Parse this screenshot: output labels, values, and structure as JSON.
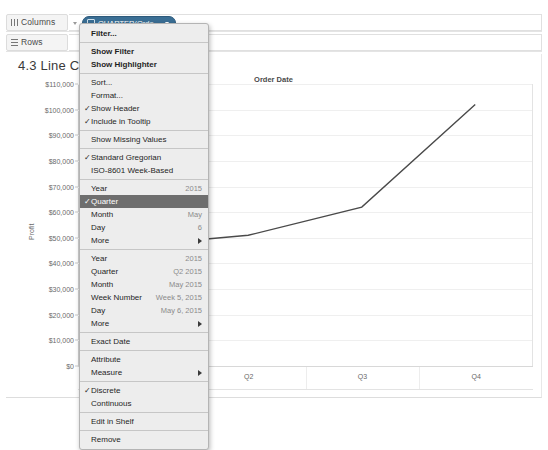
{
  "shelves": {
    "columns": {
      "label": "Columns",
      "icon": "columns-icon"
    },
    "rows": {
      "label": "Rows",
      "icon": "rows-icon"
    },
    "pill": {
      "text": "QUARTER(Orde...",
      "icon": "calendar-icon",
      "color": "#3a6e94"
    }
  },
  "sheet": {
    "title": "4.3 Line Chart",
    "chart_title": "Order Date"
  },
  "menu": {
    "items": [
      {
        "label": "Filter...",
        "check": "",
        "value": "",
        "arrow": false,
        "selected": false,
        "bold": true,
        "sep_after": true
      },
      {
        "label": "Show Filter",
        "check": "",
        "value": "",
        "arrow": false,
        "selected": false,
        "bold": true,
        "sep_after": false
      },
      {
        "label": "Show Highlighter",
        "check": "",
        "value": "",
        "arrow": false,
        "selected": false,
        "bold": true,
        "sep_after": true
      },
      {
        "label": "Sort...",
        "check": "",
        "value": "",
        "arrow": false,
        "selected": false,
        "bold": false,
        "sep_after": false
      },
      {
        "label": "Format...",
        "check": "",
        "value": "",
        "arrow": false,
        "selected": false,
        "bold": false,
        "sep_after": false
      },
      {
        "label": "Show Header",
        "check": "✓",
        "value": "",
        "arrow": false,
        "selected": false,
        "bold": false,
        "sep_after": false
      },
      {
        "label": "Include in Tooltip",
        "check": "✓",
        "value": "",
        "arrow": false,
        "selected": false,
        "bold": false,
        "sep_after": true
      },
      {
        "label": "Show Missing Values",
        "check": "",
        "value": "",
        "arrow": false,
        "selected": false,
        "bold": false,
        "sep_after": true
      },
      {
        "label": "Standard Gregorian",
        "check": "✓",
        "value": "",
        "arrow": false,
        "selected": false,
        "bold": false,
        "sep_after": false
      },
      {
        "label": "ISO-8601 Week-Based",
        "check": "",
        "value": "",
        "arrow": false,
        "selected": false,
        "bold": false,
        "sep_after": true
      },
      {
        "label": "Year",
        "check": "",
        "value": "2015",
        "arrow": false,
        "selected": false,
        "bold": false,
        "sep_after": false
      },
      {
        "label": "Quarter",
        "check": "✓",
        "value": "",
        "arrow": false,
        "selected": true,
        "bold": false,
        "sep_after": false
      },
      {
        "label": "Month",
        "check": "",
        "value": "May",
        "arrow": false,
        "selected": false,
        "bold": false,
        "sep_after": false
      },
      {
        "label": "Day",
        "check": "",
        "value": "6",
        "arrow": false,
        "selected": false,
        "bold": false,
        "sep_after": false
      },
      {
        "label": "More",
        "check": "",
        "value": "",
        "arrow": true,
        "selected": false,
        "bold": false,
        "sep_after": true
      },
      {
        "label": "Year",
        "check": "",
        "value": "2015",
        "arrow": false,
        "selected": false,
        "bold": false,
        "sep_after": false
      },
      {
        "label": "Quarter",
        "check": "",
        "value": "Q2 2015",
        "arrow": false,
        "selected": false,
        "bold": false,
        "sep_after": false
      },
      {
        "label": "Month",
        "check": "",
        "value": "May 2015",
        "arrow": false,
        "selected": false,
        "bold": false,
        "sep_after": false
      },
      {
        "label": "Week Number",
        "check": "",
        "value": "Week 5, 2015",
        "arrow": false,
        "selected": false,
        "bold": false,
        "sep_after": false
      },
      {
        "label": "Day",
        "check": "",
        "value": "May 6, 2015",
        "arrow": false,
        "selected": false,
        "bold": false,
        "sep_after": false
      },
      {
        "label": "More",
        "check": "",
        "value": "",
        "arrow": true,
        "selected": false,
        "bold": false,
        "sep_after": true
      },
      {
        "label": "Exact Date",
        "check": "",
        "value": "",
        "arrow": false,
        "selected": false,
        "bold": false,
        "sep_after": true
      },
      {
        "label": "Attribute",
        "check": "",
        "value": "",
        "arrow": false,
        "selected": false,
        "bold": false,
        "sep_after": false
      },
      {
        "label": "Measure",
        "check": "",
        "value": "",
        "arrow": true,
        "selected": false,
        "bold": false,
        "sep_after": true
      },
      {
        "label": "Discrete",
        "check": "✓",
        "value": "",
        "arrow": false,
        "selected": false,
        "bold": false,
        "sep_after": false
      },
      {
        "label": "Continuous",
        "check": "",
        "value": "",
        "arrow": false,
        "selected": false,
        "bold": false,
        "sep_after": true
      },
      {
        "label": "Edit in Shelf",
        "check": "",
        "value": "",
        "arrow": false,
        "selected": false,
        "bold": false,
        "sep_after": true
      },
      {
        "label": "Remove",
        "check": "",
        "value": "",
        "arrow": false,
        "selected": false,
        "bold": false,
        "sep_after": false
      }
    ]
  },
  "chart_data": {
    "type": "line",
    "title": "Order Date",
    "xlabel": "",
    "ylabel": "Profit",
    "categories": [
      "Q1",
      "Q2",
      "Q3",
      "Q4"
    ],
    "values": [
      47000,
      51000,
      62000,
      102000
    ],
    "ylim": [
      0,
      110000
    ],
    "ytick_labels": [
      "$0",
      "$10,000",
      "$20,000",
      "$30,000",
      "$40,000",
      "$50,000",
      "$60,000",
      "$70,000",
      "$80,000",
      "$90,000",
      "$100,000",
      "$110,000"
    ],
    "ytick_values": [
      0,
      10000,
      20000,
      30000,
      40000,
      50000,
      60000,
      70000,
      80000,
      90000,
      100000,
      110000
    ],
    "grid": true,
    "legend": "none",
    "line_color": "#4a4a4a"
  }
}
